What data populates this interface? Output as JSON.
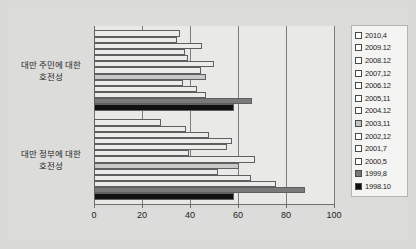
{
  "chart_data": {
    "type": "bar",
    "orientation": "horizontal",
    "title": "",
    "xlabel": "",
    "ylabel": "",
    "xlim": [
      0,
      100
    ],
    "xticks": [
      0,
      20,
      40,
      60,
      80,
      100
    ],
    "xtick_labels": [
      "0",
      "20",
      "40",
      "60",
      "80",
      "100"
    ],
    "grid": true,
    "grid_axis": "x",
    "legend_position": "right",
    "categories": [
      "대만 주민에 대한 호전성",
      "대만 정부에 대한 호전성"
    ],
    "series": [
      {
        "name": "2010.4",
        "color": "#ececea",
        "values": [
          36.0,
          28.0
        ]
      },
      {
        "name": "2009.12",
        "color": "#ececea",
        "values": [
          34.5,
          38.5
        ]
      },
      {
        "name": "2008.12",
        "color": "#ececea",
        "values": [
          45.0,
          48.0
        ]
      },
      {
        "name": "2007.12",
        "color": "#ececea",
        "values": [
          38.0,
          57.5
        ]
      },
      {
        "name": "2006.12",
        "color": "#ececea",
        "values": [
          39.0,
          55.5
        ]
      },
      {
        "name": "2005.11",
        "color": "#ececea",
        "values": [
          50.0,
          39.5
        ]
      },
      {
        "name": "2004.12",
        "color": "#ececea",
        "values": [
          44.5,
          67.0
        ]
      },
      {
        "name": "2003.11",
        "color": "#c9c9c7",
        "values": [
          46.5,
          60.5
        ]
      },
      {
        "name": "2002.12",
        "color": "#ececea",
        "values": [
          37.0,
          51.5
        ]
      },
      {
        "name": "2001.7",
        "color": "#ececea",
        "values": [
          43.0,
          65.5
        ]
      },
      {
        "name": "2000.5",
        "color": "#ececea",
        "values": [
          46.5,
          76.0
        ]
      },
      {
        "name": "1999.8",
        "color": "#7a7a7a",
        "values": [
          66.0,
          88.0
        ]
      },
      {
        "name": "1998.10",
        "color": "#111111",
        "values": [
          58.5,
          58.5
        ]
      }
    ]
  },
  "legend": {
    "items": [
      {
        "label": "2010,4",
        "swatch": "#ffffff"
      },
      {
        "label": "2009.12",
        "swatch": "#ffffff"
      },
      {
        "label": "2008.12",
        "swatch": "#ffffff"
      },
      {
        "label": "2007,12",
        "swatch": "#ffffff"
      },
      {
        "label": "2006.12",
        "swatch": "#ffffff"
      },
      {
        "label": "2005,11",
        "swatch": "#ffffff"
      },
      {
        "label": "2004.12",
        "swatch": "#ffffff"
      },
      {
        "label": "2003,11",
        "swatch": "#c4c4c2"
      },
      {
        "label": "2002,12",
        "swatch": "#ffffff"
      },
      {
        "label": "2001,7",
        "swatch": "#ffffff"
      },
      {
        "label": "2000,5",
        "swatch": "#ffffff"
      },
      {
        "label": "1999,8",
        "swatch": "#7a7a7a"
      },
      {
        "label": "1998.10",
        "swatch": "#111111"
      }
    ]
  },
  "colors": {
    "figure_background": "#d9d9d7",
    "plot_background": "#e9e9e7",
    "axis": "#6e6e6e",
    "gridline": "#7c7c7c",
    "bar_border": "#5f5f5f",
    "text": "#1d1d1d"
  }
}
